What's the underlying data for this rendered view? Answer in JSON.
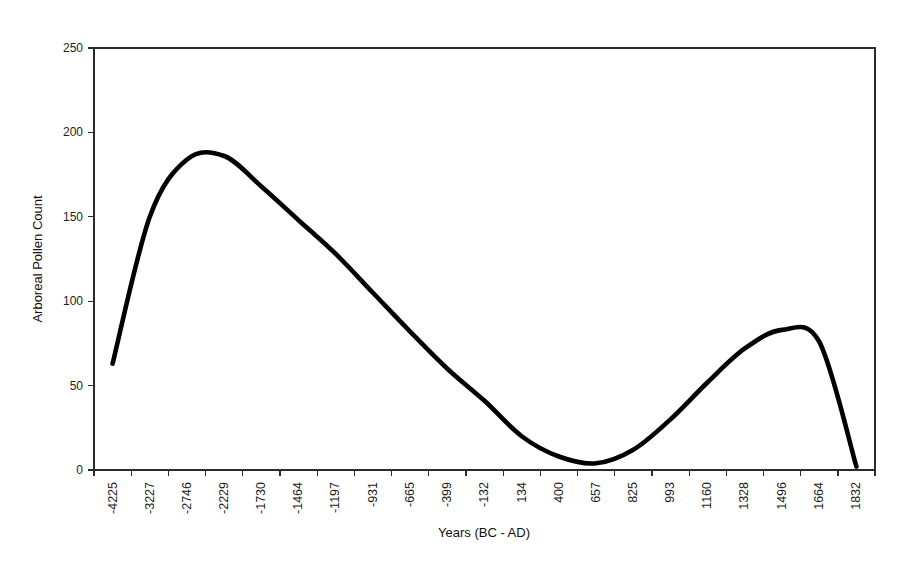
{
  "chart_data": {
    "type": "line",
    "title": "",
    "xlabel": "Years (BC - AD)",
    "ylabel": "Arboreal Pollen Count",
    "grid": false,
    "legend": false,
    "ylim": [
      0,
      250
    ],
    "yticks": [
      0,
      50,
      100,
      150,
      200,
      250
    ],
    "categories": [
      "-4225",
      "-3227",
      "-2746",
      "-2229",
      "-1730",
      "-1464",
      "-1197",
      "-931",
      "-665",
      "-399",
      "-132",
      "134",
      "400",
      "657",
      "825",
      "993",
      "1160",
      "1328",
      "1496",
      "1664",
      "1832"
    ],
    "values": [
      63,
      150,
      184,
      186,
      168,
      148,
      128,
      105,
      82,
      60,
      41,
      20,
      8,
      4,
      12,
      30,
      52,
      72,
      83,
      76,
      2
    ],
    "series": [
      {
        "name": "Arboreal Pollen Count",
        "color": "#000000",
        "values": [
          63,
          150,
          184,
          186,
          168,
          148,
          128,
          105,
          82,
          60,
          41,
          20,
          8,
          4,
          12,
          30,
          52,
          72,
          83,
          76,
          2
        ]
      }
    ],
    "annotations": {
      "left_peak_value": 186,
      "left_peak_x": "-2229",
      "trough_value": 4,
      "trough_x": "657",
      "right_peak_value": 83,
      "right_peak_x": "1496",
      "start_value": 63,
      "end_value": 2
    }
  },
  "axes": {
    "y_tick_0": "0",
    "y_tick_50": "50",
    "y_tick_100": "100",
    "y_tick_150": "150",
    "y_tick_200": "200",
    "y_tick_250": "250",
    "x_title": "Years (BC - AD)",
    "y_title": "Arboreal Pollen Count"
  },
  "xticks": {
    "t0": "-4225",
    "t1": "-3227",
    "t2": "-2746",
    "t3": "-2229",
    "t4": "-1730",
    "t5": "-1464",
    "t6": "-1197",
    "t7": "-931",
    "t8": "-665",
    "t9": "-399",
    "t10": "-132",
    "t11": "134",
    "t12": "400",
    "t13": "657",
    "t14": "825",
    "t15": "993",
    "t16": "1160",
    "t17": "1328",
    "t18": "1496",
    "t19": "1664",
    "t20": "1832"
  }
}
